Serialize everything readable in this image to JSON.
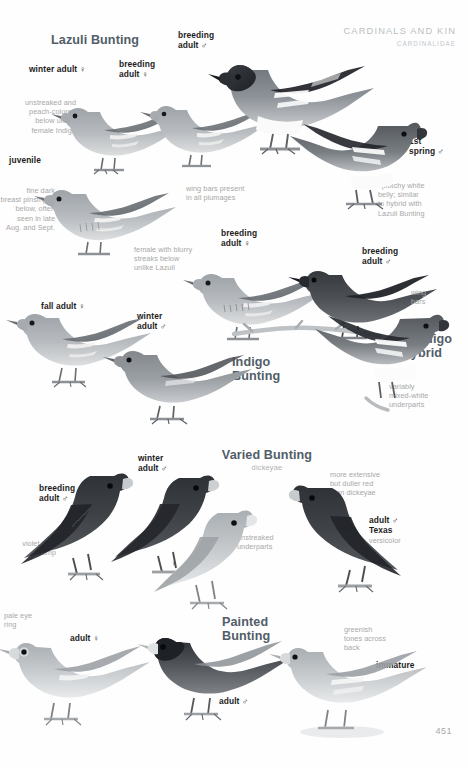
{
  "page": {
    "header_title": "CARDINALS AND KIN",
    "header_family": "CARDINALIDAE",
    "folio": "451"
  },
  "species": [
    {
      "id": "lazuli-bunting",
      "name": "Lazuli Bunting",
      "scientific": "",
      "labels": [
        {
          "name": "winter-adult-female",
          "text": "winter adult ♀"
        },
        {
          "name": "breeding-adult-female",
          "text": "breeding\nadult ♀"
        },
        {
          "name": "breeding-adult-male",
          "text": "breeding\nadult ♂"
        },
        {
          "name": "juvenile",
          "text": "juvenile"
        },
        {
          "name": "first-spring-male",
          "text": "1st\nspring ♂"
        }
      ],
      "notes": [
        {
          "name": "note-unstreaked-peach",
          "text": "unstreaked and\npeach-colored\nbelow unlike\nfemale Indigo"
        },
        {
          "name": "note-fine-dark-pinstripes",
          "text": "fine dark\nbreast pinstripes\nbelow, often\nseen in late\nAug. and Sept."
        },
        {
          "name": "note-wing-bars-all-plumages",
          "text": "wing bars present\nin all plumages"
        },
        {
          "name": "note-splotchy-white-belly",
          "text": "splotchy white\nbelly; similar\nto hybrid with\nLazuli Bunting"
        }
      ]
    },
    {
      "id": "indigo-bunting",
      "name": "Indigo\nBunting",
      "scientific": "",
      "labels": [
        {
          "name": "breeding-adult-female",
          "text": "breeding\nadult ♀"
        },
        {
          "name": "breeding-adult-male",
          "text": "breeding\nadult ♂"
        },
        {
          "name": "fall-adult-female",
          "text": "fall adult ♀"
        },
        {
          "name": "winter-adult-male",
          "text": "winter\nadult ♂"
        }
      ],
      "notes": [
        {
          "name": "note-female-blurry-streaks",
          "text": "female with blurry\nstreaks below\nunlike Lazuli"
        }
      ]
    },
    {
      "id": "lazuli-x-indigo-hybrid",
      "name": "Lazuli\nx Indigo\nhybrid",
      "scientific": "",
      "labels": [],
      "notes": [
        {
          "name": "note-wing-bars",
          "text": "wing\nbars"
        },
        {
          "name": "note-variably-mixed-white",
          "text": "variably\nmixed-white\nunderparts"
        }
      ]
    },
    {
      "id": "varied-bunting",
      "name": "Varied Bunting",
      "scientific": "dickeyae",
      "labels": [
        {
          "name": "breeding-adult-male",
          "text": "breeding\nadult ♂"
        },
        {
          "name": "winter-adult-male",
          "text": "winter\nadult ♂"
        },
        {
          "name": "adult-female-symbol",
          "text": "♀"
        },
        {
          "name": "adult-male-texas",
          "text": "adult ♂\nTexas"
        }
      ],
      "notes": [
        {
          "name": "note-violet-blue-rump",
          "text": "violet-blue\nrump"
        },
        {
          "name": "note-unstreaked-underparts",
          "text": "unstreaked\nunderparts"
        },
        {
          "name": "note-more-extensive-red",
          "text": "more extensive\nbut duller red\nthan dickeyae"
        },
        {
          "name": "note-versicolor",
          "text": "versicolor"
        }
      ]
    },
    {
      "id": "painted-bunting",
      "name": "Painted\nBunting",
      "scientific": "",
      "labels": [
        {
          "name": "adult-female",
          "text": "adult ♀"
        },
        {
          "name": "adult-male",
          "text": "adult ♂"
        },
        {
          "name": "immature",
          "text": "immature"
        }
      ],
      "notes": [
        {
          "name": "note-pale-eye-ring",
          "text": "pale eye\nring"
        },
        {
          "name": "note-greenish-tones",
          "text": "greenish\ntones across\nback"
        }
      ]
    }
  ],
  "colors": {
    "heading": "#515d68",
    "label": "#1d1d1d",
    "note": "#a8a8a8",
    "header": "#b9bec4",
    "folio": "#a9a9a9",
    "page_bg": "#fefefe"
  }
}
